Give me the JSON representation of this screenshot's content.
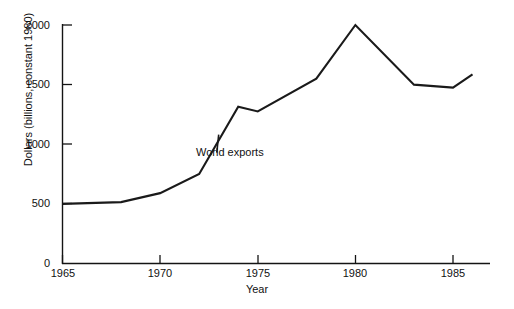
{
  "chart_data": {
    "type": "line",
    "title": "",
    "xlabel": "Year",
    "ylabel": "Dollars (billions, constant 1980)",
    "xlim": [
      1965,
      1986.5
    ],
    "ylim": [
      0,
      2100
    ],
    "grid": false,
    "legend": "none",
    "annotations": [
      {
        "text": "World exports",
        "x": 1972.9,
        "y": 930,
        "target_x": 1973.0,
        "target_y": 1080
      }
    ],
    "x_ticks": [
      1965,
      1970,
      1975,
      1980,
      1985
    ],
    "x_tick_labels": [
      "1965",
      "1970",
      "1975",
      "1980",
      "1985"
    ],
    "y_ticks": [
      0,
      500,
      1000,
      1500,
      2000
    ],
    "y_tick_labels": [
      "0",
      "500",
      "1000",
      "1500",
      "2000"
    ],
    "series": [
      {
        "name": "World exports",
        "color": "#1a1a1a",
        "x": [
          1965,
          1968,
          1970,
          1972,
          1974,
          1975,
          1978,
          1980,
          1983,
          1985,
          1986
        ],
        "values": [
          500,
          515,
          590,
          750,
          1315,
          1275,
          1550,
          2000,
          1500,
          1475,
          1585
        ]
      }
    ]
  },
  "axes": {
    "x_axis_name": "year-axis",
    "y_axis_name": "dollars-axis"
  }
}
